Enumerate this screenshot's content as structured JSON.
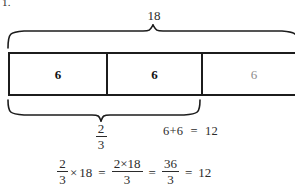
{
  "worksheet": {
    "problem_number": "1.",
    "total_label": "18",
    "bar_model": {
      "segments": [
        {
          "value": "6",
          "emphasis": "strong"
        },
        {
          "value": "6",
          "emphasis": "strong"
        },
        {
          "value": "6",
          "emphasis": "faded"
        }
      ]
    },
    "top_brace": {
      "label": "18",
      "covers": "whole-bar"
    },
    "bottom_brace": {
      "fraction_numerator": "2",
      "fraction_denominator": "3",
      "covers": "first-two-segments"
    },
    "side_sum": {
      "left": "6+6",
      "equals": "=",
      "right": "12"
    },
    "final_equation": {
      "lhs_numerator": "2",
      "lhs_denominator": "3",
      "times": "×",
      "lhs_factor": "18",
      "eq1": "=",
      "mid_numerator": "2×18",
      "mid_denominator": "3",
      "eq2": "=",
      "reduced_numerator": "36",
      "reduced_denominator": "3",
      "eq3": "=",
      "result": "12"
    }
  },
  "colors": {
    "ink": "#1c1c1c",
    "text": "#2b2b2b",
    "faded": "#8c8c8c",
    "paper": "#ffffff"
  }
}
